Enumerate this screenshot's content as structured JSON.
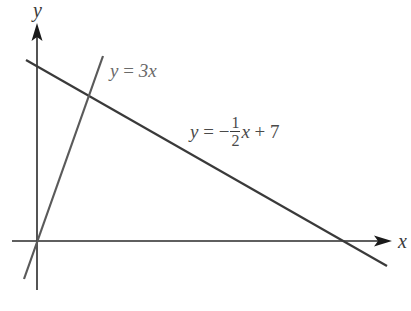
{
  "diagram": {
    "type": "coordinate-graph",
    "axes": {
      "x_label": "x",
      "y_label": "y",
      "origin_px": [
        37,
        241
      ],
      "x_axis_px": {
        "from": 12,
        "to": 391
      },
      "y_axis_px": {
        "from": 290,
        "to": 24
      }
    },
    "lines": [
      {
        "id": "line-a",
        "equation": "y = 3x",
        "label_parts": {
          "lhs": "y",
          "eq": " = ",
          "rhs": "3x"
        },
        "color": "#595959",
        "endpoints_px": [
          [
            24,
            279
          ],
          [
            103,
            56
          ]
        ]
      },
      {
        "id": "line-b",
        "equation": "y = -1/2 x + 7",
        "label_parts": {
          "lhs": "y",
          "eq": " = ",
          "minus": "−",
          "num": "1",
          "den": "2",
          "tail_var": "x",
          "tail_rest": " + 7"
        },
        "color": "#3a3a3a",
        "endpoints_px": [
          [
            26,
            60
          ],
          [
            387,
            266
          ]
        ]
      }
    ],
    "colors": {
      "axis": "#2a2a2a",
      "text": "#3a3a3a",
      "background": "#ffffff"
    }
  }
}
